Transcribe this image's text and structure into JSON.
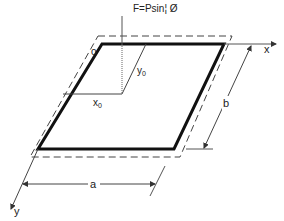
{
  "diagram": {
    "labels": {
      "force": "F=Psin¦ Ø",
      "origin": "o",
      "x_axis": "x",
      "y_axis": "y",
      "x0": "x",
      "x0_sub": "0",
      "y0": "y",
      "y0_sub": "0",
      "dim_a": "a",
      "dim_b": "b"
    },
    "colors": {
      "plate": "#111111",
      "lines": "#333333",
      "background": "#ffffff"
    }
  }
}
